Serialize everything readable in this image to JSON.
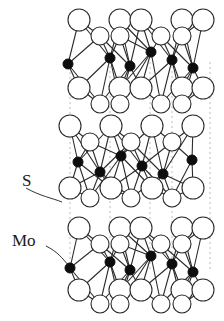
{
  "figure": {
    "title_visible": false,
    "labels": [
      {
        "id": "s-label",
        "text": "S",
        "x": 22,
        "y": 186,
        "leader": "M26,188 C40,196 52,198 62,202"
      },
      {
        "id": "mo-label",
        "text": "Mo",
        "x": 12,
        "y": 246,
        "leader": "M46,246 C58,252 62,258 69,266"
      }
    ],
    "colors": {
      "atom_s_fill": "#ffffff",
      "atom_s_stroke": "#2b2b2b",
      "atom_mo_fill": "#0d0d0d",
      "atom_mo_stroke": "#0d0d0d",
      "bond_stroke": "#2b2b2b",
      "interlayer_dash": "#c9c9c9",
      "label_color": "#1a1a1a",
      "background": "#ffffff"
    },
    "geometry": {
      "s_radius_back": 11,
      "s_radius_front": 9,
      "mo_radius": 5,
      "bond_width": 1.1,
      "dash_width": 1.2,
      "dash_pattern": "2 3"
    },
    "interlayer_dashed_lines": [
      {
        "x": 70,
        "y1": 62,
        "y2": 272
      },
      {
        "x": 110,
        "y1": 56,
        "y2": 268
      },
      {
        "x": 150,
        "y1": 62,
        "y2": 272
      },
      {
        "x": 172,
        "y1": 56,
        "y2": 266
      },
      {
        "x": 210,
        "y1": 62,
        "y2": 272
      }
    ],
    "layers": [
      {
        "id": "layer-top",
        "mo_y": 62,
        "s_top_back_y": 20,
        "s_top_front_y": 36,
        "s_bot_back_y": 88,
        "s_bot_front_y": 104,
        "mo_xs": [
          68,
          110,
          130,
          151,
          172,
          193
        ],
        "mo_ys": [
          64,
          58,
          66,
          52,
          60,
          68
        ],
        "s_top_back_xs": [
          79,
          120,
          141,
          182,
          203
        ],
        "s_top_front_xs": [
          100,
          120,
          161,
          182
        ],
        "s_bot_back_xs": [
          79,
          120,
          141,
          182,
          203
        ],
        "s_bot_front_xs": [
          100,
          120,
          161,
          182
        ]
      },
      {
        "id": "layer-middle",
        "mo_y": 166,
        "s_top_back_y": 126,
        "s_top_front_y": 142,
        "s_bot_back_y": 188,
        "s_bot_front_y": 198,
        "mo_xs": [
          78,
          100,
          121,
          142,
          163,
          192
        ],
        "mo_ys": [
          162,
          172,
          156,
          166,
          174,
          160
        ],
        "s_top_back_xs": [
          70,
          111,
          152,
          193
        ],
        "s_top_front_xs": [
          90,
          131,
          172
        ],
        "s_bot_back_xs": [
          70,
          111,
          152,
          193
        ],
        "s_bot_front_xs": [
          90,
          131,
          172
        ]
      },
      {
        "id": "layer-bottom",
        "mo_y": 266,
        "s_top_back_y": 228,
        "s_top_front_y": 244,
        "s_bot_back_y": 290,
        "s_bot_front_y": 304,
        "mo_xs": [
          70,
          110,
          130,
          151,
          172,
          193
        ],
        "mo_ys": [
          268,
          262,
          270,
          256,
          264,
          272
        ],
        "s_top_back_xs": [
          79,
          120,
          141,
          182,
          203
        ],
        "s_top_front_xs": [
          100,
          120,
          161,
          182
        ],
        "s_bot_back_xs": [
          79,
          120,
          141,
          182,
          203
        ],
        "s_bot_front_xs": [
          100,
          120,
          161,
          182
        ]
      }
    ]
  },
  "chart_data": {
    "type": "diagram",
    "title": "",
    "legend": [
      "S",
      "Mo"
    ]
  }
}
